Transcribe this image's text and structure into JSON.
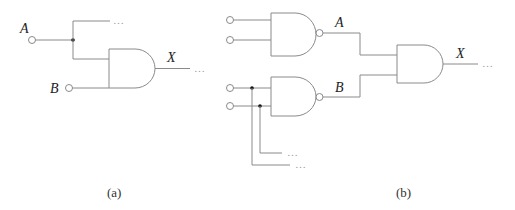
{
  "figure_a": {
    "caption": "(a)",
    "input_labels": {
      "a": "A",
      "b": "B"
    },
    "output_label": "X",
    "continuation": "…",
    "gate_type": "AND"
  },
  "figure_b": {
    "caption": "(b)",
    "intermediate_labels": {
      "a": "A",
      "b": "B"
    },
    "output_label": "X",
    "continuation": "…",
    "gates": [
      "NAND",
      "NAND",
      "AND"
    ]
  },
  "colors": {
    "wire": "#8a8a8a",
    "junction": "#111111",
    "text": "#222222"
  }
}
